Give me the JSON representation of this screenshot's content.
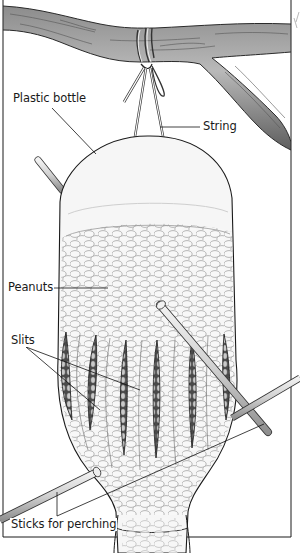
{
  "figure": {
    "labels": {
      "plastic_bottle": "Plastic bottle",
      "string": "String",
      "peanuts": "Peanuts",
      "slits": "Slits",
      "sticks": "Sticks for perching"
    },
    "colors": {
      "line": "#1a1a1a",
      "branch_fill": "#a8a8a8",
      "branch_dark": "#6e6e6e",
      "bottle_fill": "#f4f4f4",
      "peanut_fill": "#f7f7f7",
      "peanut_stroke": "#8a8a8a",
      "stick_fill": "#d9d9d9",
      "background": "#ffffff"
    }
  }
}
